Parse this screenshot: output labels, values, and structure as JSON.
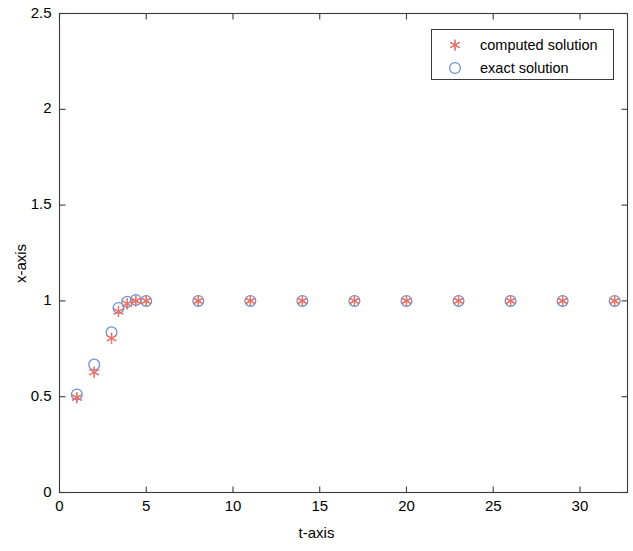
{
  "chart_data": {
    "type": "scatter",
    "title": "",
    "xlabel": "t-axis",
    "ylabel": "x-axis",
    "xlim": [
      0,
      32.74
    ],
    "ylim": [
      0,
      2.5
    ],
    "xticks": [
      0,
      5,
      10,
      15,
      20,
      25,
      30
    ],
    "xtick_labels": [
      "0",
      "5",
      "10",
      "15",
      "20",
      "25",
      "30"
    ],
    "yticks": [
      0,
      0.5,
      1,
      1.5,
      2,
      2.5
    ],
    "ytick_labels": [
      "0",
      "0.5",
      "1",
      "1.5",
      "2",
      "2.5"
    ],
    "grid": false,
    "legend_position": "upper right",
    "series": [
      {
        "name": "computed solution",
        "marker": "asterisk",
        "color": "#e8736a",
        "x": [
          1,
          2,
          3,
          3.4,
          3.9,
          4.4,
          5,
          8,
          11,
          14,
          17,
          20,
          23,
          26,
          29,
          32
        ],
        "y": [
          0.495,
          0.628,
          0.805,
          0.945,
          0.985,
          1.0,
          1.0,
          1.0,
          1.0,
          1.0,
          1.0,
          1.0,
          1.0,
          1.0,
          1.0,
          1.0
        ]
      },
      {
        "name": "exact solution",
        "marker": "circle",
        "color": "#6a8fd0",
        "x": [
          1,
          2,
          3,
          3.4,
          3.9,
          4.4,
          5,
          8,
          11,
          14,
          17,
          20,
          23,
          26,
          29,
          32
        ],
        "y": [
          0.512,
          0.668,
          0.836,
          0.963,
          0.995,
          1.005,
          1.0,
          1.0,
          1.0,
          1.0,
          1.0,
          1.0,
          1.0,
          1.0,
          1.0,
          1.0
        ]
      }
    ]
  },
  "legend": {
    "entries": [
      {
        "label": "computed solution",
        "icon": "asterisk-marker-icon"
      },
      {
        "label": "exact solution",
        "icon": "circle-marker-icon"
      }
    ]
  },
  "colors": {
    "computed": "#e8736a",
    "exact": "#6a8fd0",
    "axis": "#3a3a3a",
    "background": "#ffffff"
  }
}
